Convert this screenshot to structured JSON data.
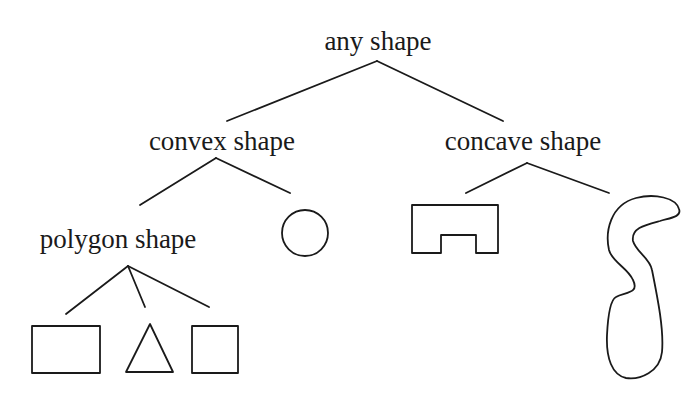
{
  "diagram": {
    "type": "tree",
    "nodes": {
      "root": {
        "label": "any shape"
      },
      "convex": {
        "label": "convex shape"
      },
      "concave": {
        "label": "concave shape"
      },
      "polygon": {
        "label": "polygon shape"
      }
    },
    "leaves": {
      "convex": [
        "circle-icon"
      ],
      "concave": [
        "notched-rectangle-icon",
        "irregular-blob-icon"
      ],
      "polygon": [
        "rectangle-icon",
        "triangle-icon",
        "square-icon"
      ]
    },
    "edges": [
      [
        "any shape",
        "convex shape"
      ],
      [
        "any shape",
        "concave shape"
      ],
      [
        "convex shape",
        "polygon shape"
      ],
      [
        "convex shape",
        "circle"
      ],
      [
        "concave shape",
        "notched rectangle"
      ],
      [
        "concave shape",
        "irregular blob"
      ],
      [
        "polygon shape",
        "rectangle"
      ],
      [
        "polygon shape",
        "triangle"
      ],
      [
        "polygon shape",
        "square"
      ]
    ],
    "colors": {
      "ink": "#1a1a1a",
      "background": "#ffffff"
    }
  }
}
